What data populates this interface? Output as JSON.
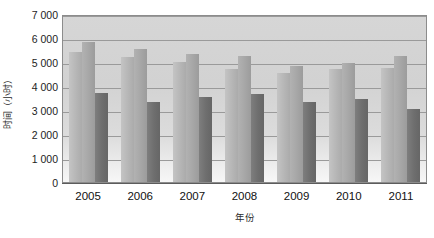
{
  "chart_data": {
    "type": "bar",
    "title": "",
    "xlabel": "年份",
    "ylabel": "时间（小时）",
    "categories": [
      "2005",
      "2006",
      "2007",
      "2008",
      "2009",
      "2010",
      "2011"
    ],
    "series": [
      {
        "name": "series-1",
        "values": [
          5400,
          5200,
          5000,
          4700,
          4550,
          4700,
          4750
        ]
      },
      {
        "name": "series-2",
        "values": [
          5850,
          5550,
          5350,
          5250,
          4850,
          4950,
          5250
        ]
      },
      {
        "name": "series-3",
        "values": [
          3700,
          3350,
          3550,
          3650,
          3350,
          3450,
          3050
        ]
      }
    ],
    "ylim": [
      0,
      7000
    ],
    "ytick_values": [
      0,
      1000,
      2000,
      3000,
      4000,
      5000,
      6000,
      7000
    ],
    "ytick_labels": [
      "0",
      "1 000",
      "2 000",
      "3 000",
      "4 000",
      "5 000",
      "6 000",
      "7 000"
    ],
    "grid": true,
    "legend": "none",
    "colors": {
      "series_1": "#b6b6b6",
      "series_2": "#a6a6a6",
      "series_3": "#6e6e6e",
      "plot_background": "#d6d6d6",
      "gridline": "#9a9a9a",
      "axis": "#5c5c5c"
    }
  }
}
